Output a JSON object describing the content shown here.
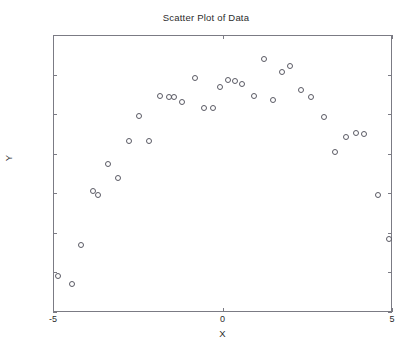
{
  "chart_data": {
    "type": "scatter",
    "title": "Scatter Plot of Data",
    "xlabel": "X",
    "ylabel": "Y",
    "xlim": [
      -5,
      5
    ],
    "ylim": [
      -60,
      10
    ],
    "xticks": [
      -5,
      0,
      5
    ],
    "xtick_labels": [
      "-5",
      "0",
      "5"
    ],
    "yticks": [
      10,
      0,
      -10,
      -20,
      -30,
      -40,
      -50,
      -60
    ],
    "ytick_labels": [
      "10",
      "0",
      "-10",
      "-20",
      "-30",
      "-40",
      "-50",
      "-60"
    ],
    "grid": false,
    "legend": false,
    "marker": "open-circle",
    "marker_color": "#5a5a64",
    "series": [
      {
        "name": "data",
        "points": [
          [
            -4.88,
            -50.7
          ],
          [
            -4.47,
            -52.7
          ],
          [
            -4.19,
            -42.8
          ],
          [
            -3.85,
            -29.2
          ],
          [
            -3.7,
            -30.2
          ],
          [
            -3.4,
            -22.3
          ],
          [
            -3.11,
            -25.8
          ],
          [
            -2.8,
            -16.5
          ],
          [
            -2.48,
            -10.2
          ],
          [
            -2.19,
            -16.6
          ],
          [
            -1.88,
            -5.2
          ],
          [
            -1.62,
            -5.3
          ],
          [
            -1.46,
            -5.3
          ],
          [
            -1.22,
            -6.8
          ],
          [
            -0.84,
            -0.5
          ],
          [
            -0.57,
            -8.2
          ],
          [
            -0.3,
            -8.2
          ],
          [
            -0.11,
            -2.8
          ],
          [
            0.12,
            -1.2
          ],
          [
            0.33,
            -1.3
          ],
          [
            0.55,
            -2.1
          ],
          [
            0.9,
            -5.2
          ],
          [
            1.2,
            4.2
          ],
          [
            1.45,
            -6.1
          ],
          [
            1.73,
            0.9
          ],
          [
            1.95,
            2.5
          ],
          [
            2.3,
            -3.6
          ],
          [
            2.58,
            -5.3
          ],
          [
            2.95,
            -10.5
          ],
          [
            3.3,
            -19.4
          ],
          [
            3.62,
            -15.4
          ],
          [
            3.9,
            -14.6
          ],
          [
            4.15,
            -14.7
          ],
          [
            4.55,
            -30.3
          ],
          [
            4.87,
            -41.2
          ]
        ]
      }
    ]
  }
}
